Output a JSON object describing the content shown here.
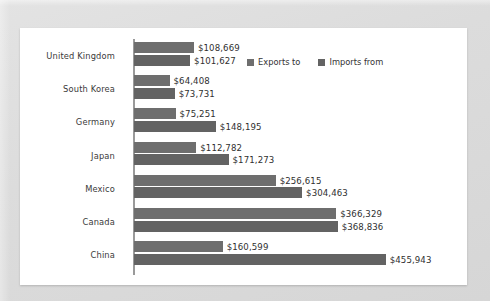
{
  "chart_data": {
    "type": "bar",
    "orientation": "horizontal",
    "title": "",
    "subtitle": "",
    "xlabel": "",
    "ylabel": "",
    "grid": false,
    "legend_position": "top-right-inside",
    "axis_max": 480000,
    "categories": [
      "United Kingdom",
      "South Korea",
      "Germany",
      "Japan",
      "Mexico",
      "Canada",
      "China"
    ],
    "series": [
      {
        "name": "Exports to",
        "color": "#6e6e6e",
        "values": [
          108669,
          64408,
          75251,
          112782,
          256615,
          366329,
          160599
        ],
        "labels": [
          "$108,669",
          "$64,408",
          "$75,251",
          "$112,782",
          "$256,615",
          "$366,329",
          "$160,599"
        ]
      },
      {
        "name": "Imports from",
        "color": "#636363",
        "values": [
          101627,
          73731,
          148195,
          171273,
          304463,
          368836,
          455943
        ],
        "labels": [
          "$101,627",
          "$73,731",
          "$148,195",
          "$171,273",
          "$304,463",
          "$368,836",
          "$455,943"
        ]
      }
    ]
  },
  "legend": {
    "items": [
      {
        "label": "Exports to",
        "color": "#6e6e6e"
      },
      {
        "label": "Imports from",
        "color": "#636363"
      }
    ]
  },
  "colors": {
    "page_background": "#dedede",
    "panel_background": "#ffffff",
    "axis": "#9a9a9a",
    "exports_bar": "#6e6e6e",
    "imports_bar": "#636363",
    "text": "#2f2f2f"
  }
}
